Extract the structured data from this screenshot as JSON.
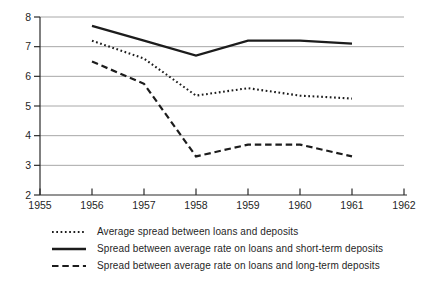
{
  "colors": {
    "line": "#1c1c1c",
    "grid": "#a8a8a8",
    "axis": "#2b2b2b",
    "text": "#1f1f1f",
    "background": "#ffffff"
  },
  "chart_data": {
    "type": "line",
    "title": "",
    "xlabel": "",
    "ylabel": "",
    "x": [
      1956,
      1957,
      1958,
      1959,
      1960,
      1961
    ],
    "series": [
      {
        "name": "Average spread between loans and deposits",
        "style": "dotted",
        "values": [
          7.2,
          6.6,
          5.35,
          5.6,
          5.35,
          5.25
        ]
      },
      {
        "name": "Spread between average rate on loans and short-term deposits",
        "style": "solid",
        "values": [
          7.7,
          7.2,
          6.7,
          7.2,
          7.2,
          7.1
        ]
      },
      {
        "name": "Spread between average rate on loans and long-term deposits",
        "style": "dashed",
        "values": [
          6.5,
          5.75,
          3.3,
          3.7,
          3.7,
          3.3
        ]
      }
    ],
    "xlim": [
      1955,
      1962
    ],
    "ylim": [
      2,
      8
    ],
    "xticks": [
      1955,
      1956,
      1957,
      1958,
      1959,
      1960,
      1961,
      1962
    ],
    "yticks": [
      2,
      3,
      4,
      5,
      6,
      7,
      8
    ],
    "grid": "horizontal-only",
    "legend_position": "bottom-left"
  }
}
